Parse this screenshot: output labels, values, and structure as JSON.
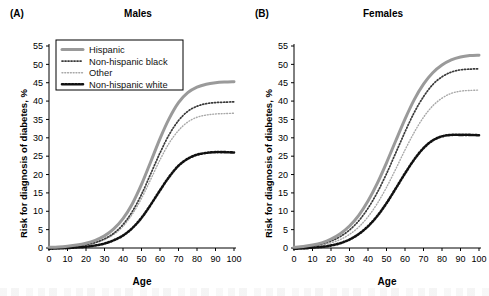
{
  "figure": {
    "panels": [
      {
        "letter": "(A)",
        "title": "Males",
        "xlabel": "Age",
        "ylabel": "Risk for diagnosis of diabetes, %"
      },
      {
        "letter": "(B)",
        "title": "Females",
        "xlabel": "Age",
        "ylabel": "Risk for diagnosis of diabetes, %"
      }
    ],
    "legend": {
      "position": "top-left-panel-a",
      "entries": [
        {
          "label": "Hispanic",
          "style": "thick-solid-gray",
          "color": "#9a9a9a"
        },
        {
          "label": "Non-hispanic black",
          "style": "dotted-dark",
          "color": "#3a3a3a"
        },
        {
          "label": "Other",
          "style": "dotted-light",
          "color": "#a8a8a8"
        },
        {
          "label": "Non-hispanic white",
          "style": "dotted-black-thick",
          "color": "#111111"
        }
      ]
    }
  },
  "chart_data": [
    {
      "type": "line",
      "title": "Males",
      "panel": "(A)",
      "xlabel": "Age",
      "ylabel": "Risk for diagnosis of diabetes, %",
      "xlim": [
        0,
        100
      ],
      "ylim": [
        0,
        55
      ],
      "xticks": [
        0,
        10,
        20,
        30,
        40,
        50,
        60,
        70,
        80,
        90,
        100
      ],
      "yticks": [
        0,
        5,
        10,
        15,
        20,
        25,
        30,
        35,
        40,
        45,
        50,
        55
      ],
      "grid": false,
      "legend_position": "upper left",
      "x": [
        0,
        5,
        10,
        15,
        20,
        25,
        30,
        35,
        40,
        45,
        50,
        55,
        60,
        65,
        70,
        75,
        80,
        85,
        90,
        95,
        100
      ],
      "series": [
        {
          "name": "Hispanic",
          "color": "#9a9a9a",
          "style": "solid",
          "width": 3.0,
          "values": [
            0.2,
            0.3,
            0.5,
            0.8,
            1.3,
            2.1,
            3.3,
            5.2,
            8.0,
            12.0,
            17.3,
            23.5,
            29.8,
            35.3,
            39.6,
            42.3,
            43.8,
            44.6,
            45.0,
            45.2,
            45.3
          ]
        },
        {
          "name": "Non-hispanic black",
          "color": "#3a3a3a",
          "style": "dotted",
          "width": 1.7,
          "values": [
            0.1,
            0.2,
            0.3,
            0.5,
            0.9,
            1.5,
            2.5,
            4.0,
            6.4,
            9.9,
            14.6,
            20.2,
            25.9,
            30.9,
            34.7,
            37.2,
            38.6,
            39.3,
            39.6,
            39.7,
            39.8
          ]
        },
        {
          "name": "Other",
          "color": "#a8a8a8",
          "style": "dotted",
          "width": 1.4,
          "values": [
            0.1,
            0.15,
            0.25,
            0.45,
            0.8,
            1.4,
            2.3,
            3.7,
            5.9,
            9.2,
            13.5,
            18.7,
            24.0,
            28.6,
            32.0,
            34.3,
            35.6,
            36.2,
            36.5,
            36.6,
            36.7
          ]
        },
        {
          "name": "Non-hispanic white",
          "color": "#111111",
          "style": "dotted",
          "width": 2.6,
          "values": [
            -0.2,
            -0.1,
            0.0,
            0.15,
            0.35,
            0.7,
            1.2,
            2.1,
            3.4,
            5.4,
            8.2,
            11.8,
            15.7,
            19.4,
            22.4,
            24.3,
            25.4,
            25.9,
            26.1,
            26.1,
            26.0
          ]
        }
      ]
    },
    {
      "type": "line",
      "title": "Females",
      "panel": "(B)",
      "xlabel": "Age",
      "ylabel": "Risk for diagnosis of diabetes, %",
      "xlim": [
        0,
        100
      ],
      "ylim": [
        0,
        55
      ],
      "xticks": [
        0,
        10,
        20,
        30,
        40,
        50,
        60,
        70,
        80,
        90,
        100
      ],
      "yticks": [
        0,
        5,
        10,
        15,
        20,
        25,
        30,
        35,
        40,
        45,
        50,
        55
      ],
      "grid": false,
      "legend_position": "none",
      "x": [
        0,
        5,
        10,
        15,
        20,
        25,
        30,
        35,
        40,
        45,
        50,
        55,
        60,
        65,
        70,
        75,
        80,
        85,
        90,
        95,
        100
      ],
      "series": [
        {
          "name": "Hispanic",
          "color": "#9a9a9a",
          "style": "solid",
          "width": 3.0,
          "values": [
            0.2,
            0.4,
            0.8,
            1.4,
            2.4,
            3.9,
            6.0,
            8.9,
            12.8,
            17.6,
            23.2,
            29.2,
            35.1,
            40.4,
            44.6,
            47.7,
            49.8,
            51.2,
            52.0,
            52.4,
            52.5
          ]
        },
        {
          "name": "Non-hispanic black",
          "color": "#3a3a3a",
          "style": "dotted",
          "width": 1.7,
          "values": [
            0.1,
            0.3,
            0.6,
            1.1,
            1.9,
            3.1,
            4.9,
            7.4,
            10.8,
            15.1,
            20.2,
            25.9,
            31.6,
            36.9,
            41.2,
            44.5,
            46.6,
            47.9,
            48.5,
            48.7,
            48.8
          ]
        },
        {
          "name": "Other",
          "color": "#a8a8a8",
          "style": "dotted",
          "width": 1.4,
          "values": [
            0.1,
            0.2,
            0.4,
            0.8,
            1.4,
            2.3,
            3.7,
            5.7,
            8.5,
            12.1,
            16.5,
            21.5,
            26.7,
            31.5,
            35.6,
            38.7,
            40.8,
            42.1,
            42.7,
            42.9,
            43.0
          ]
        },
        {
          "name": "Non-hispanic white",
          "color": "#111111",
          "style": "dotted",
          "width": 2.6,
          "values": [
            -0.2,
            -0.1,
            0.1,
            0.3,
            0.7,
            1.3,
            2.3,
            3.8,
            5.9,
            8.7,
            12.2,
            16.2,
            20.3,
            24.1,
            27.2,
            29.3,
            30.4,
            30.8,
            30.8,
            30.8,
            30.7
          ]
        }
      ]
    }
  ]
}
